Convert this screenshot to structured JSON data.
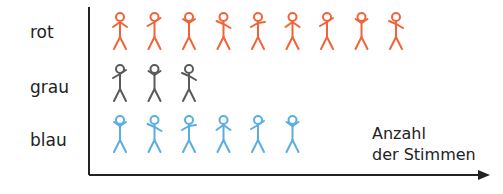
{
  "chart_data": {
    "type": "bar",
    "style": "pictogram",
    "orientation": "horizontal",
    "title": "",
    "categories": [
      "rot",
      "grau",
      "blau"
    ],
    "values": [
      9,
      3,
      6
    ],
    "colors": [
      "#f0643a",
      "#5a5a5a",
      "#5aaee0"
    ],
    "xlabel": "Anzahl der Stimmen",
    "ylabel": "",
    "icon": "stick-figure",
    "unit_per_icon": 1,
    "grid": false,
    "legend": null
  },
  "labels": {
    "rot": "rot",
    "grau": "grau",
    "blau": "blau",
    "axis_line1": "Anzahl",
    "axis_line2": "der Stimmen"
  }
}
